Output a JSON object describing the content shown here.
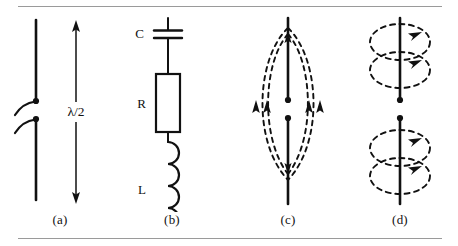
{
  "figure": {
    "background_color": "#ffffff",
    "ink_color": "#111111",
    "rule_color": "#9a9a9a",
    "width": 458,
    "height": 246
  },
  "panels": [
    {
      "id": "a",
      "caption": "(a)",
      "name": "dipole-antenna-structure",
      "description": "Vertical half-wave dipole with feed gap and two curved feed leads, dimensioned by a double-headed arrow",
      "dimension_label": "λ/2",
      "elements": [
        "antenna-wire-upper",
        "antenna-wire-lower",
        "feed-terminal-dot-upper",
        "feed-terminal-dot-lower",
        "feed-lead-curve-upper",
        "feed-lead-curve-lower",
        "dimension-arrow"
      ]
    },
    {
      "id": "b",
      "caption": "(b)",
      "name": "equivalent-rlc-circuit",
      "description": "Series equivalent circuit of the antenna: capacitance, resistance and inductance in series",
      "components": [
        {
          "symbol": "C",
          "name": "capacitor",
          "label": "C"
        },
        {
          "symbol": "R",
          "name": "resistor",
          "label": "R"
        },
        {
          "symbol": "L",
          "name": "inductor",
          "label": "L"
        }
      ]
    },
    {
      "id": "c",
      "caption": "(c)",
      "name": "electric-field-pattern",
      "description": "Dashed electric field lines forming a lens shape between the two feed terminals, with arrowheads directed upward",
      "field_type": "electric",
      "line_style": "dashed",
      "arrow_count": 4,
      "arrow_direction": "up"
    },
    {
      "id": "d",
      "caption": "(d)",
      "name": "magnetic-field-pattern",
      "description": "Dashed magnetic field loops encircling the antenna wire, two above and two below the feed gap, circulating clockwise",
      "field_type": "magnetic",
      "line_style": "dashed",
      "loop_count": 4,
      "arrow_direction": "clockwise"
    }
  ]
}
